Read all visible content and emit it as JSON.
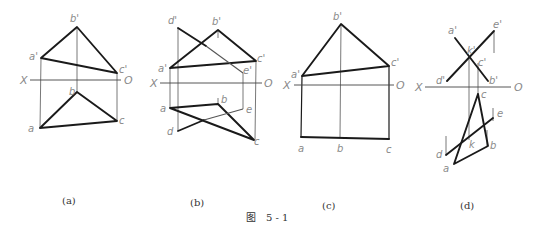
{
  "figure": {
    "caption_prefix": "图",
    "caption_number": "5 - 1"
  },
  "axis_labels": {
    "x": "X",
    "o": "O"
  },
  "panels": [
    {
      "id": "a",
      "caption": "(a)",
      "labels": {
        "b_prime": "b'",
        "a_prime": "a'",
        "c_prime": "c'",
        "b": "b",
        "a": "a",
        "c": "c"
      }
    },
    {
      "id": "b",
      "caption": "(b)",
      "labels": {
        "d_prime": "d'",
        "b_prime": "b'",
        "a_prime": "a'",
        "c_prime": "c'",
        "e_prime": "e'",
        "a": "a",
        "b": "b",
        "e": "e",
        "d": "d",
        "c": "c"
      }
    },
    {
      "id": "c",
      "caption": "(c)",
      "labels": {
        "b_prime": "b'",
        "a_prime": "a'",
        "c_prime": "c'",
        "a": "a",
        "b": "b",
        "c": "c"
      }
    },
    {
      "id": "d",
      "caption": "(d)",
      "labels": {
        "a_prime": "a'",
        "e_prime": "e'",
        "k_prime": "k'",
        "c_prime": "c'",
        "d_prime": "d'",
        "b_prime": "b'",
        "c": "c",
        "e": "e",
        "k": "k",
        "b": "b",
        "d": "d",
        "a": "a"
      }
    }
  ]
}
